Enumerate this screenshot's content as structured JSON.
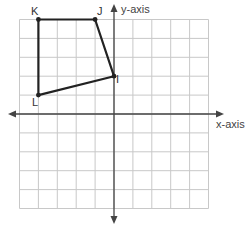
{
  "diagram": {
    "type": "coordinate-plane",
    "grid": {
      "x_min": -5,
      "x_max": 5,
      "y_min": -5,
      "y_max": 5,
      "origin_px": [
        114,
        114
      ],
      "cell_px": 18.9,
      "line_color": "#c8c8c8"
    },
    "axes": {
      "x_label": "x-axis",
      "y_label": "y-axis",
      "color": "#444444"
    },
    "polygon": {
      "stroke": "#222222",
      "vertices": [
        {
          "name": "K",
          "x": -4,
          "y": 5
        },
        {
          "name": "J",
          "x": -1,
          "y": 5
        },
        {
          "name": "I",
          "x": 0,
          "y": 2
        },
        {
          "name": "L",
          "x": -4,
          "y": 1
        }
      ]
    },
    "labels": {
      "K": "K",
      "J": "J",
      "I": "I",
      "L": "L"
    }
  }
}
